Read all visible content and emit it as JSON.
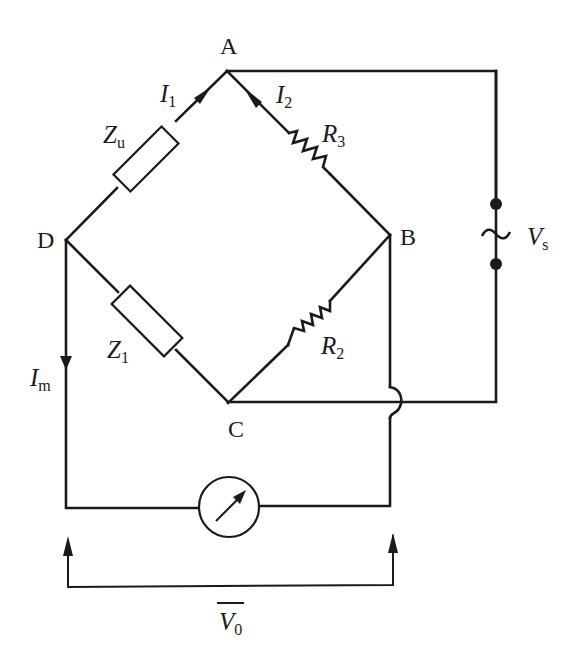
{
  "diagram": {
    "type": "AC bridge circuit",
    "nodes": {
      "A": "A",
      "B": "B",
      "C": "C",
      "D": "D"
    },
    "components": {
      "zu": {
        "symbol": "Z",
        "subscript": "u",
        "type": "impedance",
        "between": [
          "A",
          "D"
        ]
      },
      "z1": {
        "symbol": "Z",
        "subscript": "1",
        "type": "impedance",
        "between": [
          "D",
          "C"
        ]
      },
      "r3": {
        "symbol": "R",
        "subscript": "3",
        "type": "resistor",
        "between": [
          "A",
          "B"
        ]
      },
      "r2": {
        "symbol": "R",
        "subscript": "2",
        "type": "resistor",
        "between": [
          "B",
          "C"
        ]
      },
      "source": {
        "symbol": "V",
        "subscript": "s",
        "glyph": "~",
        "type": "ac-source",
        "between": [
          "A",
          "C"
        ]
      },
      "meter": {
        "type": "meter",
        "between": [
          "D",
          "B"
        ]
      }
    },
    "currents": {
      "i1": {
        "symbol": "I",
        "subscript": "1"
      },
      "i2": {
        "symbol": "I",
        "subscript": "2"
      },
      "im": {
        "symbol": "I",
        "subscript": "m"
      }
    },
    "output": {
      "symbol": "V",
      "subscript": "0",
      "overline": true
    },
    "colors": {
      "ink": "#1a1a1a",
      "background": "#ffffff"
    }
  }
}
